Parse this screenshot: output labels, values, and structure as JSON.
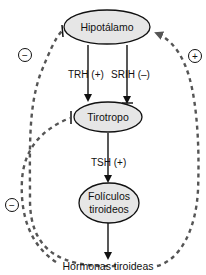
{
  "diagram": {
    "nodes": {
      "hipotalamo": {
        "label": "Hipotálamo"
      },
      "tirotropo": {
        "label": "Tirotropo"
      },
      "foliculos": {
        "label_line1": "Folículos",
        "label_line2": "tiroideos"
      },
      "hormonas": {
        "label": "Hormonas tiroideas"
      }
    },
    "edges": {
      "trh": {
        "label": "TRH (+)",
        "from": "Hipotálamo",
        "to": "Tirotropo",
        "type": "stimulatory"
      },
      "srih": {
        "label": "SRIH (–)",
        "from": "Hipotálamo",
        "to": "Tirotropo",
        "type": "inhibitory"
      },
      "tsh": {
        "label": "TSH (+)",
        "from": "Tirotropo",
        "to": "Folículos tiroideos",
        "type": "stimulatory"
      },
      "secretion": {
        "label": "",
        "from": "Folículos tiroideos",
        "to": "Hormonas tiroideas",
        "type": "stimulatory"
      }
    },
    "feedback": {
      "left_outer": {
        "sign": "−",
        "from": "Hormonas tiroideas",
        "to": "Hipotálamo",
        "type": "inhibitory"
      },
      "left_inner": {
        "sign": "−",
        "from": "Hormonas tiroideas",
        "to": "Tirotropo",
        "type": "inhibitory"
      },
      "right": {
        "sign": "+",
        "from": "Hormonas tiroideas",
        "to": "Hipotálamo",
        "type": "stimulatory"
      }
    },
    "colors": {
      "node_fill": "#e6e6e6",
      "stroke": "#111111",
      "dashed": "#555555"
    }
  }
}
